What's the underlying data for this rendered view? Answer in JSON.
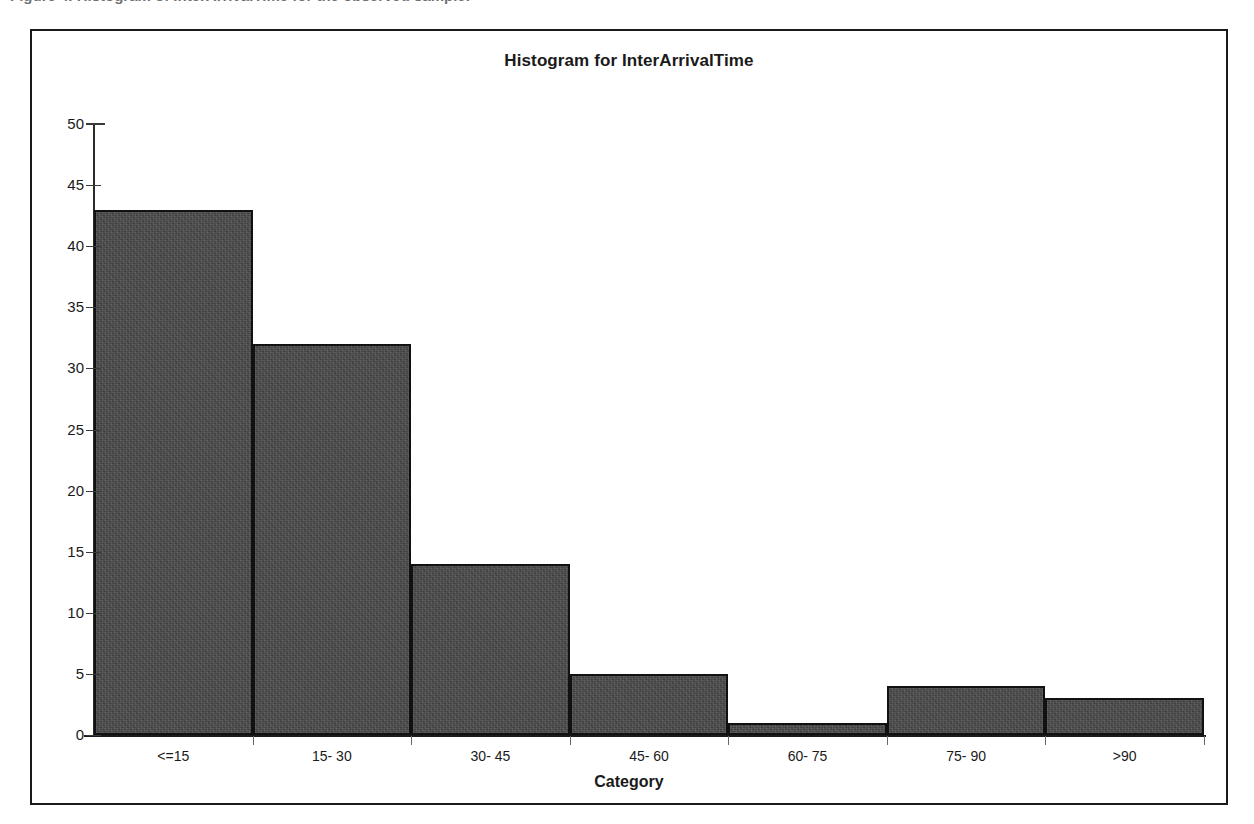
{
  "caption": {
    "text": "Figure 4.  Histogram of InterArrivalTime for the observed sample."
  },
  "figure": {
    "border_color": "#1a1a1a",
    "background": "#ffffff"
  },
  "chart_data": {
    "type": "bar",
    "title": "Histogram for InterArrivalTime",
    "xlabel": "Category",
    "ylabel": "",
    "categories": [
      "<=15",
      "15- 30",
      "30- 45",
      "45- 60",
      "60- 75",
      "75- 90",
      ">90"
    ],
    "values": [
      43,
      32,
      14,
      5,
      1,
      4,
      3
    ],
    "ylim": [
      0,
      50
    ],
    "ytick_labels": [
      "0",
      "5",
      "10",
      "15",
      "20",
      "25",
      "30",
      "35",
      "40",
      "45",
      "50"
    ],
    "ytick_values": [
      0,
      5,
      10,
      15,
      20,
      25,
      30,
      35,
      40,
      45,
      50
    ],
    "grid": false,
    "legend": false,
    "bar_fill_color": "#4a4a4a",
    "bar_border_color": "#111111",
    "axis_color": "#1a1a1a"
  }
}
